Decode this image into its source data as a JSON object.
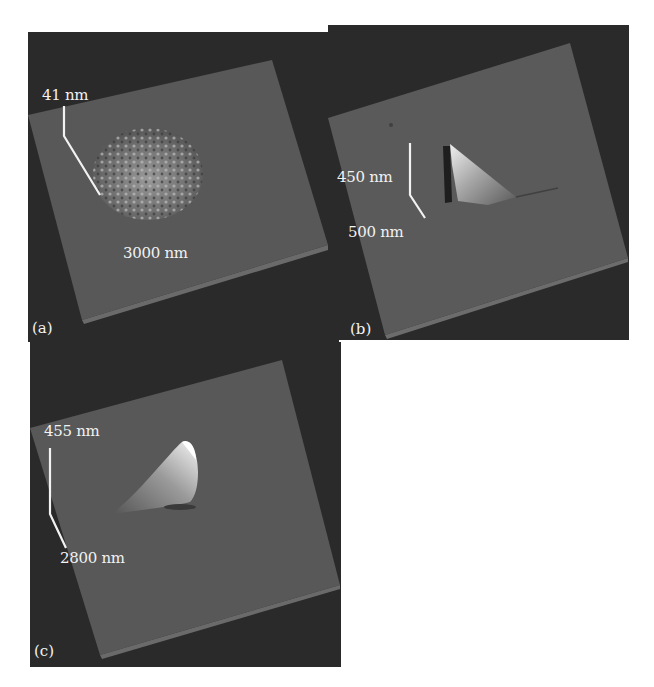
{
  "figure": {
    "panels": [
      {
        "id": "a",
        "letter": "(a)",
        "height_scale": "41 nm",
        "lateral_scale": "3000 nm",
        "feature": "rough textured mound of spikes"
      },
      {
        "id": "b",
        "letter": "(b)",
        "height_scale": "450 nm",
        "lateral_scale": "500 nm",
        "feature": "sharp triangular peak with dark shadow"
      },
      {
        "id": "c",
        "letter": "(c)",
        "height_scale": "455 nm",
        "lateral_scale": "2800 nm",
        "feature": "curved horn-shaped peak"
      }
    ],
    "colors": {
      "background": "#2a2a2a",
      "plane": "#555555",
      "text": "#f2f2f2"
    }
  }
}
